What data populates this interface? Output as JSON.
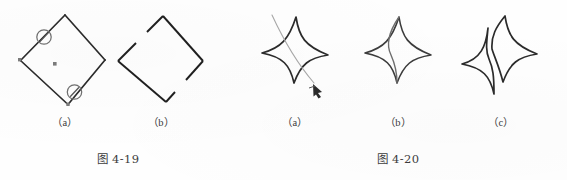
{
  "page": {
    "background_color": "#fefefe",
    "ink_color": "#2b2b2b",
    "guide_color": "#8d8d8d",
    "handle_color": "#7b7b7b"
  },
  "figures": [
    {
      "id": "fig-4-19",
      "caption": "图 4-19",
      "panels": [
        {
          "key": "a",
          "label": "（a）",
          "description": "rhombus-with-break-markers",
          "shape": "rhombus",
          "markers": [
            {
              "name": "break-marker-upper-left",
              "symbol": "∅"
            },
            {
              "name": "break-marker-lower-right",
              "symbol": "∅"
            }
          ],
          "handles": [
            "top-vertex",
            "right-vertex",
            "bottom-vertex",
            "left-vertex",
            "center"
          ]
        },
        {
          "key": "b",
          "label": "（b）",
          "description": "rhombus-with-gaps",
          "shape": "rhombus",
          "gaps": [
            "upper-left-edge",
            "lower-right-edge"
          ]
        }
      ]
    },
    {
      "id": "fig-4-20",
      "caption": "图 4-20",
      "panels": [
        {
          "key": "a",
          "label": "（a）",
          "description": "four-point-star-with-cut-line",
          "shape": "four-pointed-star",
          "overlay": "freehand-cut-curve",
          "cursor": "pen-cursor"
        },
        {
          "key": "b",
          "label": "（b）",
          "description": "four-point-star-divided",
          "shape": "four-pointed-star",
          "overlay": "division-curve"
        },
        {
          "key": "c",
          "label": "（c）",
          "description": "four-point-star-split-apart",
          "shape": "four-pointed-star",
          "overlay": "separated-halves"
        }
      ]
    }
  ],
  "labels": {
    "fig19_a": "（a）",
    "fig19_b": "（b）",
    "fig20_a": "（a）",
    "fig20_b": "（b）",
    "fig20_c": "（c）",
    "caption_19": "图 4-19",
    "caption_20": "图 4-20"
  }
}
